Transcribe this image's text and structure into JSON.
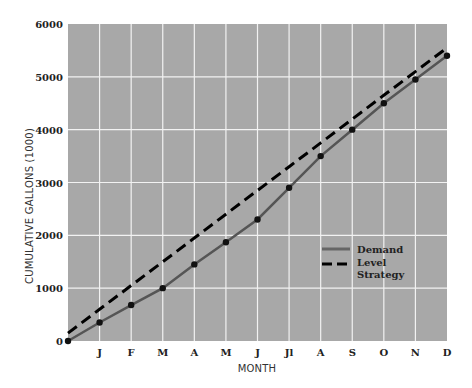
{
  "chart_data": {
    "type": "line",
    "title": "",
    "xlabel": "MONTH",
    "ylabel": "CUMULATIVE GALLONS (1000)",
    "categories": [
      "",
      "J",
      "F",
      "M",
      "A",
      "M",
      "J",
      "Jl",
      "A",
      "S",
      "O",
      "N",
      "D"
    ],
    "x_tick_labels": [
      "J",
      "F",
      "M",
      "A",
      "M",
      "J",
      "Jl",
      "A",
      "S",
      "O",
      "N",
      "D"
    ],
    "y_ticks": [
      0,
      1000,
      2000,
      3000,
      4000,
      5000,
      6000
    ],
    "ylim": [
      0,
      6000
    ],
    "grid": true,
    "legend_position": "lower right inside plot",
    "series": [
      {
        "name": "Demand",
        "style": "solid",
        "color": "#555555",
        "markers": true,
        "values": [
          0,
          350,
          680,
          1000,
          1450,
          1870,
          2300,
          2900,
          3500,
          4000,
          4500,
          4950,
          5400
        ]
      },
      {
        "name": "Level Strategy",
        "style": "dashed",
        "color": "#000000",
        "markers": false,
        "values": [
          150,
          600,
          1050,
          1500,
          1950,
          2400,
          2850,
          3300,
          3750,
          4200,
          4650,
          5100,
          5550
        ]
      }
    ]
  },
  "legend": {
    "demand": "Demand",
    "level_line1": "Level",
    "level_line2": "Strategy"
  },
  "colors": {
    "plot_bg": "#a8a8a8",
    "grid": "#f2f2f2",
    "demand": "#555555",
    "level": "#000000"
  }
}
